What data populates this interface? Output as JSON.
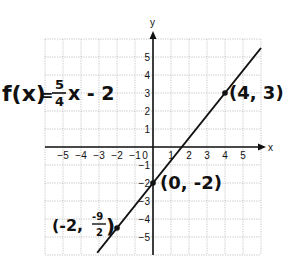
{
  "chart_data": {
    "type": "line",
    "title": "",
    "function_label": "f(x) = 5/4 x - 2",
    "xlabel": "x",
    "ylabel": "y",
    "xlim": [
      -6,
      6
    ],
    "ylim": [
      -6,
      6
    ],
    "grid": true,
    "x_ticks": [
      "-5",
      "-4",
      "-3",
      "-2",
      "-1",
      "0",
      "1",
      "2",
      "3",
      "4",
      "5"
    ],
    "y_ticks": [
      "5",
      "4",
      "3",
      "2",
      "1",
      "-1",
      "-2",
      "-3",
      "-4",
      "-5"
    ],
    "series": [
      {
        "name": "f(x) = 5/4 x - 2",
        "slope": 1.25,
        "intercept": -2,
        "x": [
          -3.1,
          6
        ],
        "y": [
          -5.875,
          5.5
        ]
      }
    ],
    "points": [
      {
        "x": 4,
        "y": 3,
        "label": "(4, 3)"
      },
      {
        "x": 0,
        "y": -2,
        "label": "(0, -2)"
      },
      {
        "x": -2,
        "y": -4.5,
        "label": "(-2, -9/2)"
      }
    ]
  },
  "labels": {
    "function": "f(x) = 5/4 x - 2",
    "func_f": "f(x)",
    "func_eq": "=",
    "func_num": "5",
    "func_den": "4",
    "func_rest": "x - 2",
    "x_axis": "x",
    "y_axis": "y",
    "pt1": "(4, 3)",
    "pt2": "(0, -2)",
    "pt3_open": "(-2,",
    "pt3_num": "-9",
    "pt3_den": "2",
    "pt3_close": ")"
  }
}
